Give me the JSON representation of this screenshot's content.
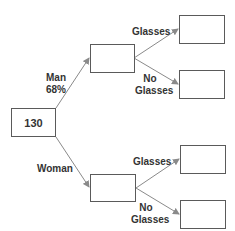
{
  "root": {
    "value": "130"
  },
  "branches": {
    "man": {
      "label": "Man",
      "percent": "68%"
    },
    "woman": {
      "label": "Woman"
    }
  },
  "sub_branches": {
    "man_glasses": {
      "label": "Glasses"
    },
    "man_no_glasses": {
      "line1": "No",
      "line2": "Glasses"
    },
    "woman_glasses": {
      "label": "Glasses"
    },
    "woman_no_glasses": {
      "line1": "No",
      "line2": "Glasses"
    }
  },
  "boxes": {
    "man": "",
    "woman": "",
    "man_glasses": "",
    "man_no_glasses": "",
    "woman_glasses": "",
    "woman_no_glasses": ""
  },
  "colors": {
    "line": "#8a8a8a",
    "box_border": "#5a5a5a",
    "text": "#333333"
  }
}
